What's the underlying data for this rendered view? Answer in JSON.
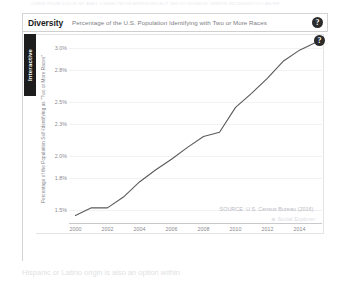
{
  "page": {
    "top_text": "LOREM IPSUM DOLOR SIT AMET CONSECTETUR ADIPISCING ELIT SED DO EIUSMOD TEMPOR INCIDIDUNT UT LABORE",
    "bottom_text": "Hispanic or Latino origin is also an option within"
  },
  "widget": {
    "title": "Diversity",
    "subtitle": "Percentage of the U.S. Population Identifying with Two or More Races",
    "help_icon": "help-question-icon",
    "help_label": "?",
    "help_icon_inner": "help-question-icon",
    "help_label_inner": "?",
    "interactive_tab_label": "Interactive"
  },
  "chart_data": {
    "type": "line",
    "title": "Percentage of the U.S. Population Identifying with Two or More Races",
    "xlabel": "",
    "ylabel": "Percentage of the Population Self-Identifying as \"Two or More Races\"",
    "x": [
      2000,
      2001,
      2002,
      2003,
      2004,
      2005,
      2006,
      2007,
      2008,
      2009,
      2010,
      2011,
      2012,
      2013,
      2014,
      2015
    ],
    "values": [
      1.45,
      1.52,
      1.52,
      1.62,
      1.76,
      1.87,
      1.97,
      2.08,
      2.18,
      2.22,
      2.45,
      2.58,
      2.72,
      2.88,
      2.98,
      3.05
    ],
    "ytick_labels": [
      "3.0%",
      "2.8%",
      "2.5%",
      "2.3%",
      "2.0%",
      "1.8%",
      "1.5%"
    ],
    "ytick_values": [
      3.0,
      2.8,
      2.5,
      2.3,
      2.0,
      1.8,
      1.5
    ],
    "xtick_labels": [
      "2000",
      "2002",
      "2004",
      "2006",
      "2008",
      "2010",
      "2012",
      "2014"
    ],
    "xtick_values": [
      2000,
      2002,
      2004,
      2006,
      2008,
      2010,
      2012,
      2014
    ],
    "xlim": [
      1999.6,
      2015.4
    ],
    "ylim": [
      1.38,
      3.12
    ],
    "grid": true,
    "legend": "none",
    "line_color": "#5a5a5a",
    "source_note": "SOURCE: U.S. Census Bureau (2016).",
    "watermark": "Social Explorer",
    "watermark_glyph": "◈"
  }
}
